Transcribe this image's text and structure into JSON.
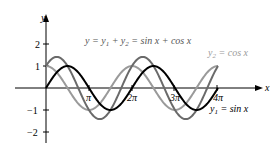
{
  "chart_data": {
    "type": "line",
    "title": "",
    "xlabel": "x",
    "ylabel": "y",
    "x_ticks": [
      "π",
      "2π",
      "3π",
      "4π"
    ],
    "y_ticks": [
      "2",
      "1",
      "−1",
      "−2"
    ],
    "xlim": [
      0,
      12.566
    ],
    "ylim": [
      -2,
      2
    ],
    "grid": false,
    "series": [
      {
        "name": "y1 = sin x",
        "expr": "sin(x)",
        "color": "#000000"
      },
      {
        "name": "y2 = cos x",
        "expr": "cos(x)",
        "color": "#9a9a9a"
      },
      {
        "name": "y = y1 + y2 = sin x + cos x",
        "expr": "sin(x)+cos(x)",
        "color": "#5a5a5a"
      }
    ],
    "annotations": [
      "y = y1 + y2 = sin x + cos x",
      "y2 = cos x",
      "y1 = sin x"
    ]
  },
  "labels": {
    "y_axis": "y",
    "x_axis": "x",
    "tick_2": "2",
    "tick_1": "1",
    "tick_m1": "−1",
    "tick_m2": "−2",
    "tick_pi": "π",
    "tick_2pi": "2π",
    "tick_3pi": "3π",
    "tick_4pi": "4π",
    "sum_prefix": "y = y",
    "sum_mid": " + y",
    "sum_suffix": " =  sin x + cos x",
    "cos_prefix": "y",
    "cos_suffix": " = cos x",
    "sin_prefix": "y",
    "sin_suffix": " = sin x",
    "sub1": "1",
    "sub2": "2"
  }
}
